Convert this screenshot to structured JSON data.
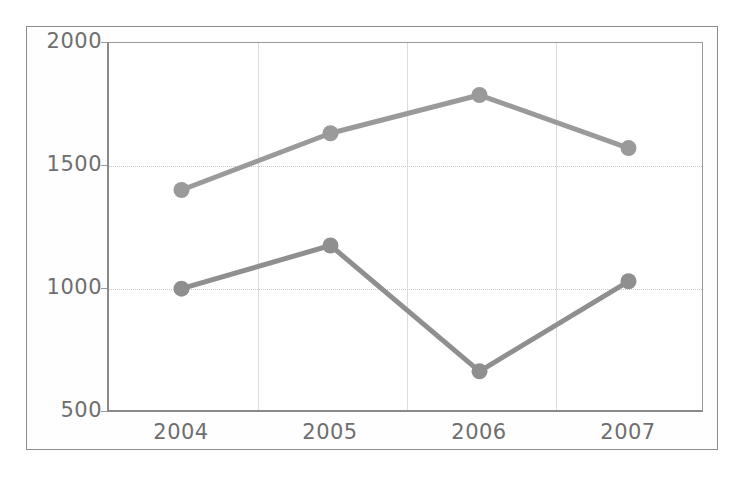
{
  "chart_data": {
    "type": "line",
    "title": "",
    "subtitle": "",
    "xlabel": "",
    "ylabel": "",
    "categories": [
      "2004",
      "2005",
      "2006",
      "2007"
    ],
    "series": [
      {
        "name": "series-1",
        "values": [
          1400,
          1630,
          1785,
          1570
        ],
        "color": "#9a9a9a"
      },
      {
        "name": "series-2",
        "values": [
          1000,
          1175,
          665,
          1030
        ],
        "color": "#8f8f8f"
      }
    ],
    "ylim": [
      500,
      2000
    ],
    "y_ticks": [
      500,
      1000,
      1500,
      2000
    ],
    "y_tick_labels": [
      "500",
      "1000",
      "1500",
      "2000"
    ],
    "x_tick_labels": [
      "2004",
      "2005",
      "2006",
      "2007"
    ],
    "grid": true,
    "grid_horizontal": true,
    "grid_vertical": true,
    "legend": false,
    "legend_position": "none",
    "markers": true,
    "marker_shape": "circle",
    "annotations": []
  },
  "style": {
    "background": "#ffffff",
    "frame_color": "#8d8d8d",
    "axis_color": "#8a8a8a",
    "gridline_color": "#c9c9c9",
    "tick_label_color": "#6e6e6e",
    "series_color_1": "#9a9a9a",
    "series_color_2": "#8f8f8f"
  }
}
